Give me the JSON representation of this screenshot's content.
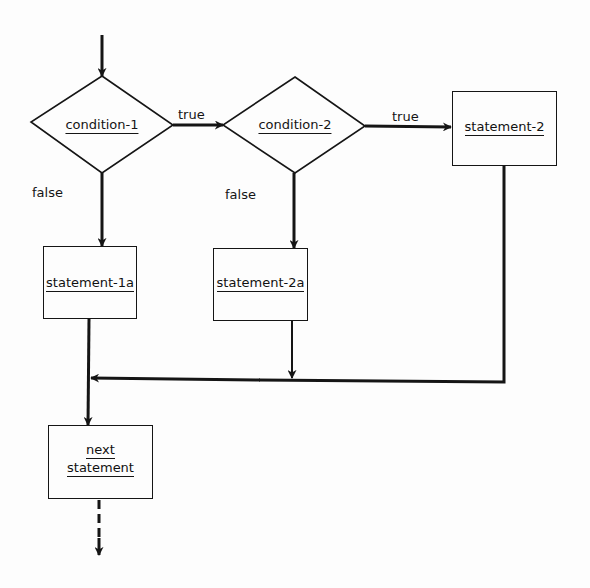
{
  "diagram": {
    "type": "flowchart",
    "colors": {
      "stroke": "#151515",
      "background": "#fdfdfd"
    },
    "nodes": {
      "condition1": {
        "shape": "diamond",
        "label": "condition-1"
      },
      "condition2": {
        "shape": "diamond",
        "label": "condition-2"
      },
      "statement2": {
        "shape": "rectangle",
        "label": "statement-2"
      },
      "statement1a": {
        "shape": "rectangle",
        "label": "statement-1a"
      },
      "statement2a": {
        "shape": "rectangle",
        "label": "statement-2a"
      },
      "next_statement": {
        "shape": "rectangle",
        "label_line1": "next",
        "label_line2": "statement"
      }
    },
    "edge_labels": {
      "c1_true": "true",
      "c1_false": "false",
      "c2_true": "true",
      "c2_false": "false"
    },
    "edges": [
      {
        "from": "entry",
        "to": "condition1"
      },
      {
        "from": "condition1",
        "to": "condition2",
        "label": "true"
      },
      {
        "from": "condition1",
        "to": "statement1a",
        "label": "false"
      },
      {
        "from": "condition2",
        "to": "statement2",
        "label": "true"
      },
      {
        "from": "condition2",
        "to": "statement2a",
        "label": "false"
      },
      {
        "from": "statement1a",
        "to": "next_statement"
      },
      {
        "from": "statement2a",
        "to": "next_statement",
        "via": "merge-line"
      },
      {
        "from": "statement2",
        "to": "next_statement",
        "via": "merge-line"
      },
      {
        "from": "next_statement",
        "to": "continuation",
        "style": "dashed"
      }
    ]
  }
}
